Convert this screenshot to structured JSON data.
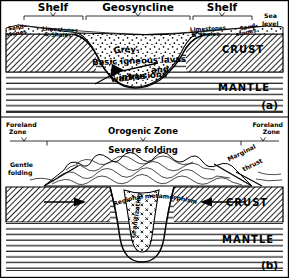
{
  "figure": {
    "title_a": "(a)",
    "title_b": "(b)"
  },
  "diagram_a": {
    "zones": [
      {
        "id": "shelf-left",
        "label": "Shelf"
      },
      {
        "id": "geosyncline",
        "label": "Geosyncline"
      },
      {
        "id": "shelf-right",
        "label": "Shelf"
      }
    ],
    "sea_level": {
      "line1": "Sea",
      "line2": "level"
    },
    "sediments": [
      {
        "id": "sandstones-left",
        "line1": "Sand-",
        "line2": "stones"
      },
      {
        "id": "limestones-shales-left",
        "line1": "Limestones",
        "line2": "& Shales"
      },
      {
        "id": "limestones-shales-right",
        "line1": "Limestones",
        "line2": "& Shales"
      },
      {
        "id": "sandstones-right",
        "line1": "Sand-",
        "line2": "stones"
      }
    ],
    "basin_fill": {
      "greywackes_part1": "Grey-",
      "greywackes_part2": "wackes",
      "igneous_line1": "Basic igneous lavas",
      "igneous_line2": "and",
      "igneous_line3": "intrusions"
    },
    "layers": [
      {
        "id": "crust",
        "label": "CRUST"
      },
      {
        "id": "mantle",
        "label": "MANTLE"
      }
    ]
  },
  "diagram_b": {
    "zones": [
      {
        "id": "foreland-left",
        "line1": "Foreland",
        "line2": "Zone"
      },
      {
        "id": "orogenic",
        "label": "Orogenic Zone"
      },
      {
        "id": "foreland-right",
        "line1": "Foreland",
        "line2": "Zone"
      }
    ],
    "annotations": [
      {
        "id": "severe-folding",
        "label": "Severe folding"
      },
      {
        "id": "gentle-folding",
        "line1": "Gentle",
        "line2": "folding"
      },
      {
        "id": "regional-metamorphism",
        "label": "Regional metamorphism"
      },
      {
        "id": "granitization",
        "label": "Granitization"
      },
      {
        "id": "marginal-thrust",
        "line1": "Marginal",
        "line2": "thrust"
      }
    ],
    "layers": [
      {
        "id": "crust",
        "label": "CRUST"
      },
      {
        "id": "mantle",
        "label": "MANTLE"
      }
    ]
  },
  "colors": {
    "ink": "#000000",
    "paper": "#ffffff",
    "crust_hatch": "#000000"
  }
}
